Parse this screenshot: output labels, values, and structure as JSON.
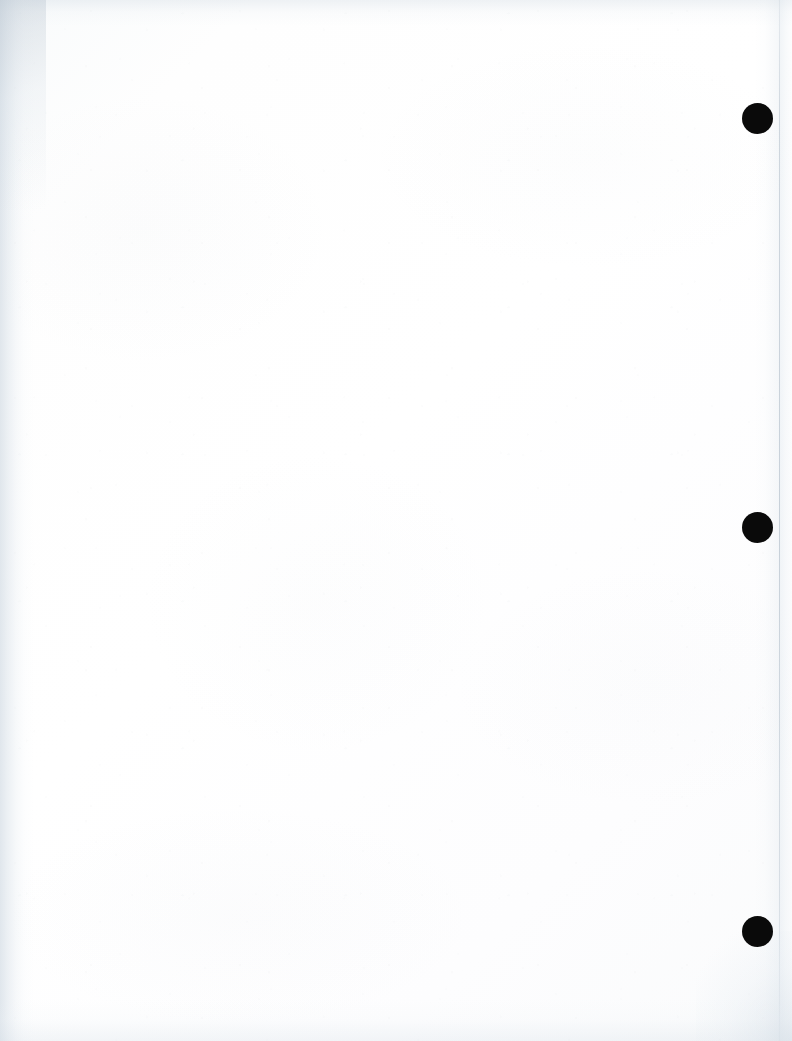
{
  "page": {
    "kind": "scanned-document-page",
    "label": "Blank scanned page",
    "width": 792,
    "height": 1041,
    "content_text": "",
    "background_color": "#fdfdfd",
    "paper_tone": "#ffffff"
  },
  "marks": {
    "name": "registration-dots",
    "description": "Three solid black circular marks in the right margin",
    "color": "#0a0a0a",
    "count": 3,
    "diameter": 31,
    "items": [
      {
        "id": "dot-1",
        "label": "Registration mark 1",
        "cx": 757,
        "cy": 118,
        "r": 15.5
      },
      {
        "id": "dot-2",
        "label": "Registration mark 2",
        "cx": 757,
        "cy": 527,
        "r": 15.5
      },
      {
        "id": "dot-3",
        "label": "Registration mark 3",
        "cx": 757,
        "cy": 931,
        "r": 15.5
      }
    ]
  },
  "edges": {
    "left_shadow_color": "#c4d0db",
    "right_edge_line_color": "#acb9c6",
    "right_margin_tint": "#e2e9ef",
    "bottom_tint": "#d6dfe7",
    "top_tint": "#ced8e1",
    "right_edge_x": 779
  }
}
